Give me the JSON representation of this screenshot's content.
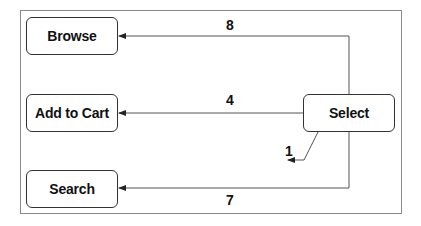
{
  "diagram": {
    "type": "state-transition",
    "colors": {
      "line": "#555555",
      "border": "#333333",
      "text": "#111111",
      "frame": "#8a8a8a"
    },
    "nodes": [
      {
        "id": "browse",
        "label": "Browse"
      },
      {
        "id": "add_to_cart",
        "label": "Add to Cart"
      },
      {
        "id": "search",
        "label": "Search"
      },
      {
        "id": "select",
        "label": "Select"
      }
    ],
    "edges": [
      {
        "from": "select",
        "to": "browse",
        "label": "8"
      },
      {
        "from": "select",
        "to": "add_to_cart",
        "label": "4"
      },
      {
        "from": "select",
        "to": "search",
        "label": "7"
      },
      {
        "from": "select",
        "to": "select",
        "label": "1"
      }
    ]
  }
}
